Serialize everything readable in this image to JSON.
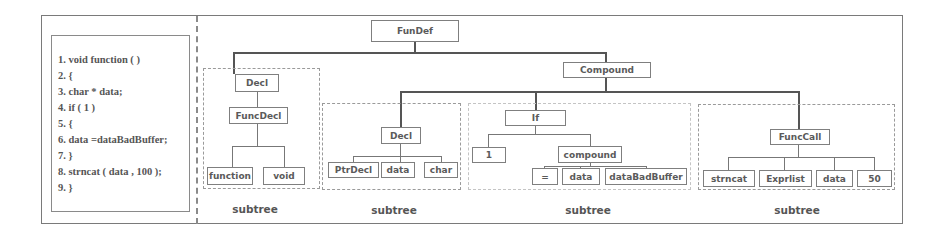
{
  "code": {
    "lines": [
      "1.  void function ( )",
      "2. {",
      "3.  char * data;",
      "4.  if ( 1 )",
      "5.  {",
      "6.  data =dataBadBuffer;",
      "7.  }",
      "8. strncat ( data , 100 );",
      "9. }"
    ]
  },
  "tree": {
    "root": "FunDef",
    "compound": "Compound",
    "subtree1": {
      "decl": "Decl",
      "funcdecl": "FuncDecl",
      "leaves": [
        "function",
        "void"
      ],
      "label": "subtree"
    },
    "subtree2": {
      "decl": "Decl",
      "leaves": [
        "PtrDecl",
        "data",
        "char"
      ],
      "label": "subtree"
    },
    "subtree3": {
      "if": "If",
      "cond": "1",
      "compound": "compound",
      "leaves": [
        "=",
        "data",
        "dataBadBuffer"
      ],
      "label": "subtree"
    },
    "subtree4": {
      "funccall": "FuncCall",
      "leaves": [
        "strncat",
        "Exprlist",
        "data",
        "50"
      ],
      "label": "subtree"
    }
  }
}
